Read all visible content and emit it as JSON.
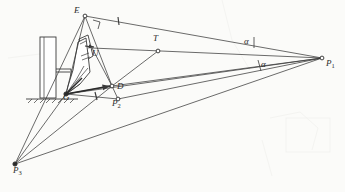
{
  "figure": {
    "background_color": "#fbfbf9",
    "line_color": "#3a3a3a",
    "label_color": "#2b2b2b"
  },
  "points": [
    {
      "id": "E",
      "label": "E",
      "sub": "",
      "x": 85,
      "y": 16,
      "label_x": 74,
      "label_y": 10,
      "marker": "open"
    },
    {
      "id": "U",
      "label": "U",
      "sub": "",
      "x": 92,
      "y": 48,
      "label_x": 92,
      "label_y": 53,
      "marker": "arrow"
    },
    {
      "id": "T",
      "label": "T",
      "sub": "",
      "x": 158,
      "y": 51,
      "label_x": 153,
      "label_y": 38,
      "marker": "open"
    },
    {
      "id": "D",
      "label": "D",
      "sub": "",
      "x": 112,
      "y": 86,
      "label_x": 117,
      "label_y": 86,
      "marker": "open"
    },
    {
      "id": "G",
      "label": "G",
      "sub": "",
      "x": 65,
      "y": 94,
      "label_x": 64,
      "label_y": 97,
      "marker": "filled"
    },
    {
      "id": "P1",
      "label": "P",
      "sub": "1",
      "x": 322,
      "y": 58,
      "label_x": 326,
      "label_y": 63,
      "marker": "open"
    },
    {
      "id": "P2",
      "label": "P",
      "sub": "2",
      "x": 118,
      "y": 99,
      "label_x": 113,
      "label_y": 103,
      "marker": "open"
    },
    {
      "id": "P3",
      "label": "P",
      "sub": "3",
      "x": 15,
      "y": 164,
      "label_x": 14,
      "label_y": 170,
      "marker": "filled"
    }
  ],
  "angles": [
    {
      "id": "alpha-upper",
      "label": "α",
      "x": 244,
      "y": 41
    },
    {
      "id": "alpha-lower",
      "label": "α",
      "x": 261,
      "y": 64
    }
  ],
  "tick_marks": [
    {
      "id": "tick-e-p1",
      "x": 118,
      "y": 21
    },
    {
      "id": "tick-g-p1",
      "x": 96,
      "y": 96
    }
  ],
  "markers": {
    "right_angle": "right-angle-marker",
    "ground_hatch": "ground-hatching"
  },
  "legend": {
    "note": ""
  }
}
